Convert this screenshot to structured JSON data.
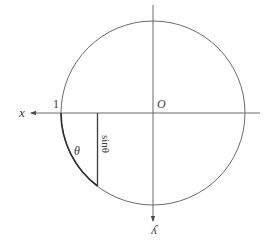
{
  "diagram": {
    "labels": {
      "x_axis": "x",
      "y_axis": "y",
      "origin": "O",
      "one": "1",
      "theta": "θ",
      "sin_theta": "sinθ"
    },
    "colors": {
      "stroke": "#5a5a5a",
      "arc_highlight": "#2a2a2a",
      "text": "#3a3a3a"
    }
  }
}
